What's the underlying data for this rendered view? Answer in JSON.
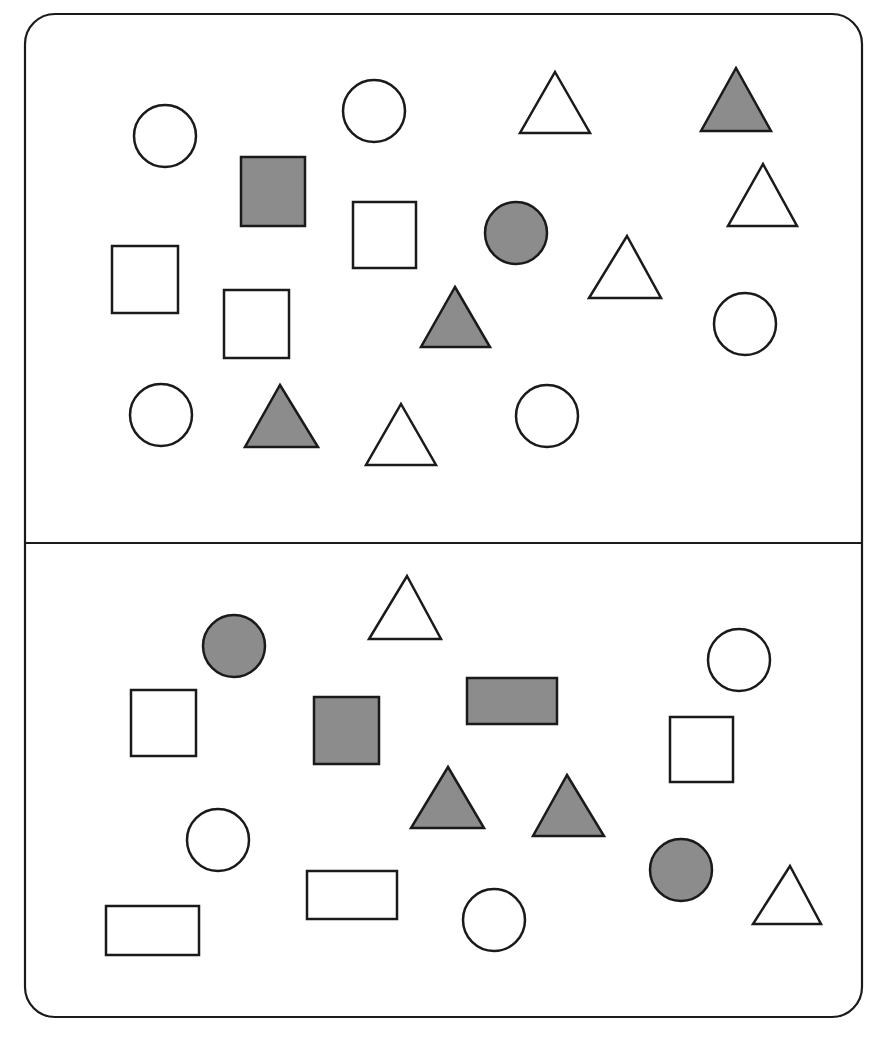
{
  "figure": {
    "width": 882,
    "height": 1038,
    "background": "#ffffff",
    "stroke_color": "#1a1a1a",
    "fill_color": "#8c8c8c",
    "frame": {
      "x": 25,
      "y": 14,
      "width": 837,
      "height": 1003,
      "radius": 30
    },
    "divider_y": 543
  },
  "panels": [
    {
      "name": "top-panel",
      "shapes": [
        {
          "type": "circle",
          "filled": false,
          "cx": 165,
          "cy": 136,
          "r": 31
        },
        {
          "type": "circle",
          "filled": false,
          "cx": 374,
          "cy": 111,
          "r": 31
        },
        {
          "type": "triangle",
          "filled": false,
          "apex": [
            555,
            72
          ],
          "base_y": 133,
          "x1": 520,
          "x2": 590
        },
        {
          "type": "triangle",
          "filled": true,
          "apex": [
            736,
            68
          ],
          "base_y": 131,
          "x1": 701,
          "x2": 771
        },
        {
          "type": "rect",
          "filled": true,
          "x": 241,
          "y": 157,
          "w": 64,
          "h": 69
        },
        {
          "type": "rect",
          "filled": false,
          "x": 353,
          "y": 202,
          "w": 63,
          "h": 66
        },
        {
          "type": "circle",
          "filled": true,
          "cx": 516,
          "cy": 233,
          "r": 31
        },
        {
          "type": "triangle",
          "filled": false,
          "apex": [
            763,
            164
          ],
          "base_y": 226,
          "x1": 728,
          "x2": 797
        },
        {
          "type": "rect",
          "filled": false,
          "x": 112,
          "y": 246,
          "w": 66,
          "h": 67
        },
        {
          "type": "triangle",
          "filled": false,
          "apex": [
            627,
            236
          ],
          "base_y": 298,
          "x1": 589,
          "x2": 661
        },
        {
          "type": "rect",
          "filled": false,
          "x": 224,
          "y": 290,
          "w": 65,
          "h": 68
        },
        {
          "type": "triangle",
          "filled": true,
          "apex": [
            455,
            287
          ],
          "base_y": 347,
          "x1": 421,
          "x2": 490
        },
        {
          "type": "circle",
          "filled": false,
          "cx": 745,
          "cy": 324,
          "r": 31
        },
        {
          "type": "circle",
          "filled": false,
          "cx": 161,
          "cy": 415,
          "r": 31
        },
        {
          "type": "triangle",
          "filled": true,
          "apex": [
            280,
            385
          ],
          "base_y": 447,
          "x1": 245,
          "x2": 318
        },
        {
          "type": "triangle",
          "filled": false,
          "apex": [
            401,
            404
          ],
          "base_y": 465,
          "x1": 366,
          "x2": 436
        },
        {
          "type": "circle",
          "filled": false,
          "cx": 547,
          "cy": 416,
          "r": 31
        }
      ]
    },
    {
      "name": "bottom-panel",
      "shapes": [
        {
          "type": "triangle",
          "filled": false,
          "apex": [
            407,
            576
          ],
          "base_y": 639,
          "x1": 369,
          "x2": 441
        },
        {
          "type": "circle",
          "filled": true,
          "cx": 234,
          "cy": 646,
          "r": 31
        },
        {
          "type": "circle",
          "filled": false,
          "cx": 739,
          "cy": 660,
          "r": 31
        },
        {
          "type": "rect",
          "filled": false,
          "x": 131,
          "y": 690,
          "w": 65,
          "h": 66
        },
        {
          "type": "rect",
          "filled": true,
          "x": 314,
          "y": 697,
          "w": 65,
          "h": 67
        },
        {
          "type": "rect",
          "filled": true,
          "x": 467,
          "y": 678,
          "w": 90,
          "h": 46
        },
        {
          "type": "rect",
          "filled": false,
          "x": 670,
          "y": 717,
          "w": 63,
          "h": 65
        },
        {
          "type": "triangle",
          "filled": true,
          "apex": [
            448,
            767
          ],
          "base_y": 828,
          "x1": 411,
          "x2": 484
        },
        {
          "type": "triangle",
          "filled": true,
          "apex": [
            567,
            775
          ],
          "base_y": 836,
          "x1": 533,
          "x2": 604
        },
        {
          "type": "circle",
          "filled": false,
          "cx": 218,
          "cy": 840,
          "r": 31
        },
        {
          "type": "circle",
          "filled": true,
          "cx": 681,
          "cy": 870,
          "r": 31
        },
        {
          "type": "triangle",
          "filled": false,
          "apex": [
            790,
            866
          ],
          "base_y": 924,
          "x1": 753,
          "x2": 821
        },
        {
          "type": "rect",
          "filled": false,
          "x": 307,
          "y": 871,
          "w": 90,
          "h": 48
        },
        {
          "type": "circle",
          "filled": false,
          "cx": 494,
          "cy": 920,
          "r": 31
        },
        {
          "type": "rect",
          "filled": false,
          "x": 106,
          "y": 906,
          "w": 93,
          "h": 49
        }
      ]
    }
  ]
}
